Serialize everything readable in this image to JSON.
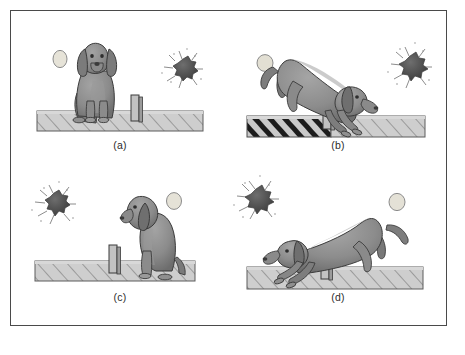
{
  "figure": {
    "border_color": "#4a4a4a",
    "background_color": "#ffffff",
    "panel_count": 4
  },
  "palette": {
    "dog_body": "#8e8e8e",
    "dog_shadow": "#6f6f6f",
    "dog_outline": "#3a3a3a",
    "floor_fill": "#c9c9c9",
    "floor_hatch": "#6a6a6a",
    "floor_electrified": "#1f1f1f",
    "barrier_fill": "#bdbdbd",
    "barrier_outline": "#3b3b3b",
    "light_stimulus": "#e4e1d6",
    "light_stimulus_outline": "#8d8d8d",
    "shock_stimulus": "#4f4f4f",
    "shock_rays": "#6b6b6b",
    "label_text": "#2b2b2b"
  },
  "panels": [
    {
      "id": "a",
      "label": "(a)",
      "dog_pose": "sitting-facing-viewer",
      "dog_side": "left",
      "light_stimulus": {
        "present": true,
        "side": "left",
        "shape": "plain-circle"
      },
      "shock_stimulus": {
        "present": true,
        "side": "right",
        "shape": "spiky-starburst"
      },
      "floor": {
        "left_electrified": false,
        "right_electrified": false
      },
      "barrier": {
        "present": true,
        "position": "center"
      }
    },
    {
      "id": "b",
      "label": "(b)",
      "dog_pose": "leaping-rightward",
      "dog_side": "crossing",
      "light_stimulus": {
        "present": true,
        "side": "left",
        "shape": "plain-circle"
      },
      "shock_stimulus": {
        "present": true,
        "side": "right",
        "shape": "spiky-starburst"
      },
      "floor": {
        "left_electrified": true,
        "right_electrified": false
      },
      "barrier": {
        "present": true,
        "position": "center"
      }
    },
    {
      "id": "c",
      "label": "(c)",
      "dog_pose": "sitting-facing-left",
      "dog_side": "right",
      "light_stimulus": {
        "present": true,
        "side": "right",
        "shape": "plain-circle"
      },
      "shock_stimulus": {
        "present": true,
        "side": "left",
        "shape": "spiky-starburst"
      },
      "floor": {
        "left_electrified": false,
        "right_electrified": false
      },
      "barrier": {
        "present": true,
        "position": "center"
      }
    },
    {
      "id": "d",
      "label": "(d)",
      "dog_pose": "leaping-leftward",
      "dog_side": "crossing",
      "light_stimulus": {
        "present": true,
        "side": "right",
        "shape": "plain-circle"
      },
      "shock_stimulus": {
        "present": true,
        "side": "left",
        "shape": "spiky-starburst"
      },
      "floor": {
        "left_electrified": false,
        "right_electrified": false
      },
      "barrier": {
        "present": true,
        "position": "center"
      }
    }
  ]
}
